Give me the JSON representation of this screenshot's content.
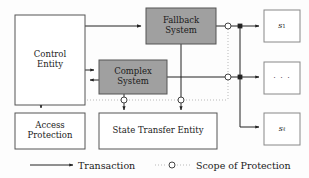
{
  "diagram": {
    "colors": {
      "background": "#fdfdfd",
      "box_stroke": "#555555",
      "box_fill_plain": "#ffffff",
      "box_fill_shaded": "#a0a0a0",
      "line_solid": "#222222",
      "line_dotted": "#bbbbbb",
      "text": "#1a1a1a"
    },
    "nodes": [
      {
        "id": "control_entity",
        "label": "Control\nEntity",
        "shaded": false,
        "x": 15,
        "y": 15,
        "w": 70,
        "h": 90
      },
      {
        "id": "fallback_system",
        "label": "Fallback\nSystem",
        "shaded": true,
        "x": 146,
        "y": 8,
        "w": 70,
        "h": 36
      },
      {
        "id": "complex_system",
        "label": "Complex\nSystem",
        "shaded": true,
        "x": 99,
        "y": 60,
        "w": 68,
        "h": 34
      },
      {
        "id": "access_protection",
        "label": "Access\nProtection",
        "shaded": false,
        "x": 15,
        "y": 113,
        "w": 70,
        "h": 36
      },
      {
        "id": "state_transfer",
        "label": "State Transfer Entity",
        "shaded": false,
        "x": 99,
        "y": 113,
        "w": 118,
        "h": 36
      },
      {
        "id": "service_1",
        "label": "s1",
        "shaded": false,
        "x": 264,
        "y": 10,
        "w": 36,
        "h": 32
      },
      {
        "id": "service_dots",
        "label": "· · ·",
        "shaded": false,
        "x": 264,
        "y": 62,
        "w": 36,
        "h": 32
      },
      {
        "id": "service_l",
        "label": "sl",
        "shaded": false,
        "x": 264,
        "y": 113,
        "w": 36,
        "h": 32
      }
    ],
    "service_labels": {
      "s1_base": "s",
      "s1_sub": "1",
      "sl_base": "s",
      "sl_sub": "ℓ",
      "dots": "· · ·"
    },
    "legend": {
      "items": [
        {
          "id": "transaction",
          "label": "Transaction",
          "style": "solid-arrow"
        },
        {
          "id": "scope",
          "label": "Scope of Protection",
          "style": "dotted-circle"
        }
      ]
    }
  }
}
